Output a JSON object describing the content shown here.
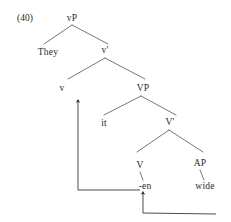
{
  "figure": {
    "example_number": "(40)",
    "type": "syntax-tree",
    "ink_color": "#2b2b2b",
    "background_color": "#ffffff"
  },
  "tree": {
    "nodes": [
      {
        "id": "vP",
        "label": "vP",
        "x": 72,
        "y": 18,
        "kind": "phrase"
      },
      {
        "id": "They",
        "label": "They",
        "x": 48,
        "y": 52,
        "kind": "terminal"
      },
      {
        "id": "vbar",
        "label": "v'",
        "x": 105,
        "y": 50,
        "kind": "bar"
      },
      {
        "id": "v",
        "label": "v",
        "x": 62,
        "y": 88,
        "kind": "head"
      },
      {
        "id": "VP",
        "label": "VP",
        "x": 143,
        "y": 88,
        "kind": "phrase"
      },
      {
        "id": "it",
        "label": "it",
        "x": 104,
        "y": 123,
        "kind": "terminal"
      },
      {
        "id": "Vbar",
        "label": "V'",
        "x": 170,
        "y": 122,
        "kind": "bar"
      },
      {
        "id": "V",
        "label": "V",
        "x": 140,
        "y": 165,
        "kind": "head"
      },
      {
        "id": "AP",
        "label": "AP",
        "x": 200,
        "y": 163,
        "kind": "phrase"
      },
      {
        "id": "en",
        "label": "-en",
        "x": 145,
        "y": 186,
        "kind": "terminal"
      },
      {
        "id": "wide",
        "label": "wide",
        "x": 205,
        "y": 186,
        "kind": "terminal"
      }
    ],
    "branches": [
      {
        "from": "vP",
        "to": "They",
        "x1": 72,
        "y1": 25,
        "x2": 44,
        "y2": 44
      },
      {
        "from": "vP",
        "to": "vbar",
        "x1": 72,
        "y1": 25,
        "x2": 108,
        "y2": 44
      },
      {
        "from": "vbar",
        "to": "v",
        "x1": 105,
        "y1": 58,
        "x2": 68,
        "y2": 79
      },
      {
        "from": "vbar",
        "to": "VP",
        "x1": 105,
        "y1": 58,
        "x2": 145,
        "y2": 79
      },
      {
        "from": "VP",
        "to": "it",
        "x1": 141,
        "y1": 96,
        "x2": 104,
        "y2": 115
      },
      {
        "from": "VP",
        "to": "Vbar",
        "x1": 141,
        "y1": 96,
        "x2": 176,
        "y2": 115
      },
      {
        "from": "Vbar",
        "to": "V",
        "x1": 169,
        "y1": 130,
        "x2": 137,
        "y2": 152
      },
      {
        "from": "Vbar",
        "to": "AP",
        "x1": 169,
        "y1": 130,
        "x2": 203,
        "y2": 152
      },
      {
        "from": "V",
        "to": "en",
        "x1": 140,
        "y1": 172,
        "x2": 143,
        "y2": 180
      },
      {
        "from": "AP",
        "to": "wide",
        "x1": 200,
        "y1": 170,
        "x2": 204,
        "y2": 180
      }
    ],
    "movements": [
      {
        "id": "head-movement-V-to-v",
        "label": "",
        "path": "M 140 190 L 78 190 L 78 101",
        "arrow_at": {
          "x": 78,
          "y": 101
        },
        "description": "-en raises to v"
      },
      {
        "id": "movement-AP-to-V",
        "label": "",
        "path": "M 216 214 L 143 213 L 143 193",
        "arrow_at": {
          "x": 143,
          "y": 193
        },
        "description": "wide raises to -en"
      }
    ]
  }
}
